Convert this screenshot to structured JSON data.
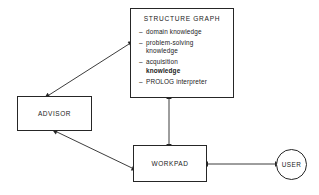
{
  "diagram": {
    "background_color": "#ffffff",
    "line_color": "#262626",
    "nodes": {
      "structure_graph": {
        "title": "STRUCTURE  GRAPH",
        "shape": "rectangle",
        "items": [
          {
            "dash": "–",
            "lines": [
              "domain knowledge"
            ],
            "bold": [
              false
            ]
          },
          {
            "dash": "–",
            "lines": [
              "problem-solving",
              "knowledge"
            ],
            "bold": [
              false,
              false
            ]
          },
          {
            "dash": "–",
            "lines": [
              "acquisition",
              "knowledge"
            ],
            "bold": [
              false,
              true
            ]
          },
          {
            "dash": "–",
            "lines": [
              "PROLOG interpreter"
            ],
            "bold": [
              false
            ]
          }
        ]
      },
      "advisor": {
        "label": "ADVISOR",
        "shape": "rectangle"
      },
      "workpad": {
        "label": "WORKPAD",
        "shape": "rectangle"
      },
      "user": {
        "label": "USER",
        "shape": "circle"
      }
    },
    "connections": [
      {
        "name": "advisor-structure-graph",
        "from": "advisor",
        "to": "structure_graph",
        "arrows": "both"
      },
      {
        "name": "advisor-workpad",
        "from": "advisor",
        "to": "workpad",
        "arrows": "both"
      },
      {
        "name": "structure-graph-workpad",
        "from": "structure_graph",
        "to": "workpad",
        "arrows": "both"
      },
      {
        "name": "workpad-user",
        "from": "workpad",
        "to": "user",
        "arrows": "both"
      }
    ]
  }
}
